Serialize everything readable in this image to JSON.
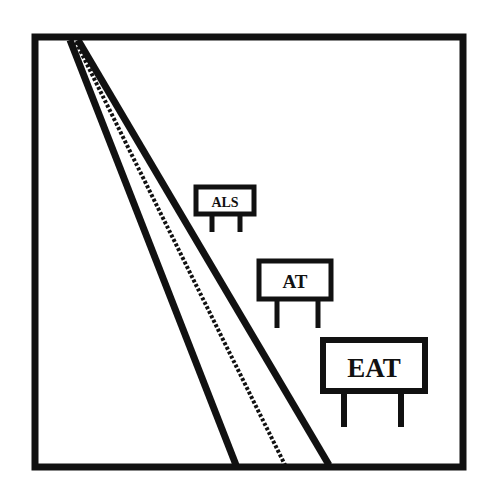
{
  "scene": {
    "description": "Road receding into distance with roadside signs",
    "colors": {
      "ink": "#111111",
      "background": "#ffffff"
    }
  },
  "signs": [
    {
      "label": "ALS"
    },
    {
      "label": "AT"
    },
    {
      "label": "EAT"
    }
  ]
}
